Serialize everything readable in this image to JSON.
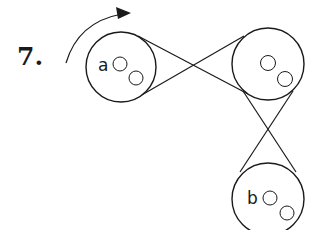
{
  "problem": {
    "number_label": "7.",
    "rotation_direction": "clockwise-arrow-icon"
  },
  "pulleys": [
    {
      "id": "a",
      "label": "a",
      "cx": 121,
      "cy": 67,
      "r": 35
    },
    {
      "id": "top-right",
      "label": "",
      "cx": 268,
      "cy": 64,
      "r": 36
    },
    {
      "id": "b",
      "label": "b",
      "cx": 268,
      "cy": 197,
      "r": 36
    }
  ],
  "belts": [
    {
      "from": "a",
      "to": "top-right",
      "type": "crossed"
    },
    {
      "from": "top-right",
      "to": "b",
      "type": "crossed"
    }
  ],
  "colors": {
    "stroke": "#1a1a1a",
    "background": "#ffffff"
  }
}
